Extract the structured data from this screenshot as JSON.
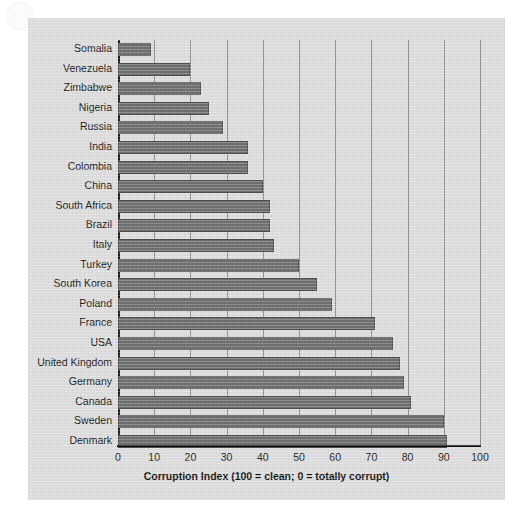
{
  "chart_data": {
    "type": "bar",
    "orientation": "horizontal",
    "title": "",
    "xlabel": "Corruption Index (100 = clean; 0 = totally corrupt)",
    "ylabel": "",
    "xlim": [
      0,
      100
    ],
    "xticks": [
      0,
      10,
      20,
      30,
      40,
      50,
      60,
      70,
      80,
      90,
      100
    ],
    "grid": "vertical",
    "legend": "none",
    "bar_color": "#6f6f6f",
    "plot_background": "#dcdcdc",
    "categories": [
      "Somalia",
      "Venezuela",
      "Zimbabwe",
      "Nigeria",
      "Russia",
      "India",
      "Colombia",
      "China",
      "South Africa",
      "Brazil",
      "Italy",
      "Turkey",
      "South Korea",
      "Poland",
      "France",
      "USA",
      "United Kingdom",
      "Germany",
      "Canada",
      "Sweden",
      "Denmark"
    ],
    "values": [
      9,
      20,
      23,
      25,
      29,
      36,
      36,
      40,
      42,
      42,
      43,
      50,
      55,
      59,
      71,
      76,
      78,
      79,
      81,
      90,
      91
    ]
  },
  "axis": {
    "tick_labels": [
      "0",
      "10",
      "20",
      "30",
      "40",
      "50",
      "60",
      "70",
      "80",
      "90",
      "100"
    ],
    "x_axis_title": "Corruption Index (100 = clean; 0 = totally corrupt)"
  }
}
